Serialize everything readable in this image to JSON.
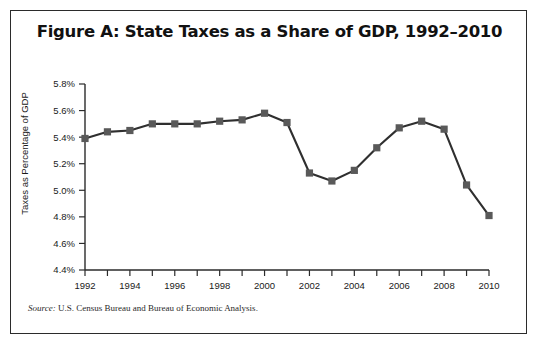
{
  "figure": {
    "title": "Figure A: State Taxes as a Share of GDP, 1992–2010",
    "source_prefix": "Source:",
    "source_text": " U.S. Census Bureau and Bureau of Economic Analysis.",
    "border_color": "#2b2b2b"
  },
  "chart_data": {
    "type": "line",
    "title": "Figure A: State Taxes as a Share of GDP, 1992–2010",
    "xlabel": "",
    "ylabel": "Taxes as Percentage of GDP",
    "x": [
      1992,
      1993,
      1994,
      1995,
      1996,
      1997,
      1998,
      1999,
      2000,
      2001,
      2002,
      2003,
      2004,
      2005,
      2006,
      2007,
      2008,
      2009,
      2010
    ],
    "values": [
      5.39,
      5.44,
      5.45,
      5.5,
      5.5,
      5.5,
      5.52,
      5.53,
      5.58,
      5.51,
      5.13,
      5.07,
      5.15,
      5.32,
      5.47,
      5.52,
      5.46,
      5.04,
      4.81
    ],
    "series": [
      {
        "name": "State taxes as a share of GDP",
        "values": [
          5.39,
          5.44,
          5.45,
          5.5,
          5.5,
          5.5,
          5.52,
          5.53,
          5.58,
          5.51,
          5.13,
          5.07,
          5.15,
          5.32,
          5.47,
          5.52,
          5.46,
          5.04,
          4.81
        ]
      }
    ],
    "ylim": [
      4.4,
      5.8
    ],
    "xlim": [
      1992,
      2010
    ],
    "ytick_values": [
      4.4,
      4.6,
      4.8,
      5.0,
      5.2,
      5.4,
      5.6,
      5.8
    ],
    "ytick_labels": [
      "4.4%",
      "4.6%",
      "4.8%",
      "5.0%",
      "5.2%",
      "5.4%",
      "5.6%",
      "5.8%"
    ],
    "xtick_values": [
      1992,
      1993,
      1994,
      1995,
      1996,
      1997,
      1998,
      1999,
      2000,
      2001,
      2002,
      2003,
      2004,
      2005,
      2006,
      2007,
      2008,
      2009,
      2010
    ],
    "xtick_labels_shown": [
      "1992",
      "1994",
      "1996",
      "1998",
      "2000",
      "2002",
      "2004",
      "2006",
      "2008",
      "2010"
    ],
    "grid": false,
    "legend": "none",
    "line_color": "#2f2f2f",
    "marker_color": "#595959",
    "marker": "square"
  }
}
